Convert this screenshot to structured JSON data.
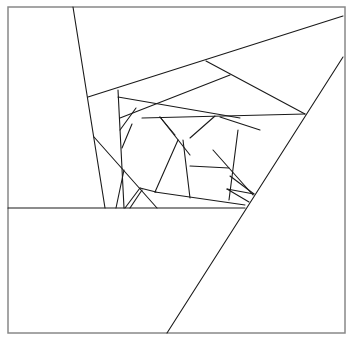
{
  "diagram": {
    "title": "",
    "background": "#ffffff",
    "stroke_color": "#1a1a1a",
    "frame_color": "#888888",
    "frame": {
      "x": 8,
      "y": 7,
      "width": 337,
      "height": 326
    },
    "segments": [
      {
        "id": "steep-left",
        "x1": 73,
        "y1": 7,
        "x2": 105,
        "y2": 208
      },
      {
        "id": "upper-diagonal",
        "x1": 88,
        "y1": 97,
        "x2": 343,
        "y2": 16
      },
      {
        "id": "right-long-diagonal",
        "x1": 343,
        "y1": 57,
        "x2": 167,
        "y2": 333
      },
      {
        "id": "horizontal-base",
        "x1": 8,
        "y1": 208,
        "x2": 245,
        "y2": 208
      },
      {
        "id": "inner-vertical-left",
        "x1": 118,
        "y1": 90,
        "x2": 124,
        "y2": 208
      },
      {
        "id": "inner-top-a",
        "x1": 118,
        "y1": 97,
        "x2": 240,
        "y2": 118
      },
      {
        "id": "inner-top-b",
        "x1": 206,
        "y1": 61,
        "x2": 305,
        "y2": 114
      },
      {
        "id": "inner-mid-a",
        "x1": 120,
        "y1": 118,
        "x2": 230,
        "y2": 75
      },
      {
        "id": "inner-mid-b",
        "x1": 142,
        "y1": 118,
        "x2": 305,
        "y2": 114
      },
      {
        "id": "inner-wedge-a",
        "x1": 120,
        "y1": 130,
        "x2": 136,
        "y2": 108
      },
      {
        "id": "inner-wedge-b",
        "x1": 122,
        "y1": 148,
        "x2": 132,
        "y2": 124
      },
      {
        "id": "pentagon-left-edge",
        "x1": 160,
        "y1": 117,
        "x2": 190,
        "y2": 155
      },
      {
        "id": "pentagon-top-left",
        "x1": 160,
        "y1": 117,
        "x2": 175,
        "y2": 135
      },
      {
        "id": "pentagon-top",
        "x1": 190,
        "y1": 138,
        "x2": 215,
        "y2": 116
      },
      {
        "id": "pentagon-right-edge",
        "x1": 220,
        "y1": 117,
        "x2": 260,
        "y2": 130
      },
      {
        "id": "pentagon-right-vert",
        "x1": 238,
        "y1": 130,
        "x2": 229,
        "y2": 200
      },
      {
        "id": "pentagon-mid-horizontal",
        "x1": 190,
        "y1": 166,
        "x2": 229,
        "y2": 168
      },
      {
        "id": "pentagon-inner-vert",
        "x1": 183,
        "y1": 140,
        "x2": 190,
        "y2": 198
      },
      {
        "id": "pentagon-bottom",
        "x1": 155,
        "y1": 192,
        "x2": 245,
        "y2": 205
      },
      {
        "id": "pentagon-left-long",
        "x1": 155,
        "y1": 192,
        "x2": 178,
        "y2": 140
      },
      {
        "id": "right-wedge-a",
        "x1": 230,
        "y1": 176,
        "x2": 254,
        "y2": 194
      },
      {
        "id": "right-wedge-b",
        "x1": 227,
        "y1": 189,
        "x2": 254,
        "y2": 194
      },
      {
        "id": "right-wedge-c",
        "x1": 227,
        "y1": 189,
        "x2": 249,
        "y2": 202
      },
      {
        "id": "lower-left-diag",
        "x1": 94,
        "y1": 137,
        "x2": 157,
        "y2": 208
      },
      {
        "id": "lower-left-vert",
        "x1": 124,
        "y1": 170,
        "x2": 116,
        "y2": 208
      },
      {
        "id": "lower-fan-a",
        "x1": 140,
        "y1": 188,
        "x2": 125,
        "y2": 208
      },
      {
        "id": "lower-fan-b",
        "x1": 142,
        "y1": 190,
        "x2": 130,
        "y2": 208
      },
      {
        "id": "lower-fan-c",
        "x1": 140,
        "y1": 188,
        "x2": 156,
        "y2": 192
      },
      {
        "id": "right-triangle-edge",
        "x1": 213,
        "y1": 150,
        "x2": 253,
        "y2": 195
      }
    ]
  }
}
